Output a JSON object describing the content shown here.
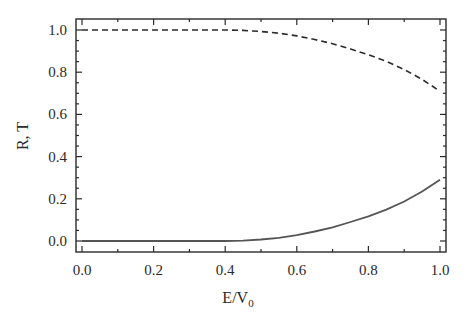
{
  "chart_data": {
    "type": "line",
    "title": "",
    "xlabel": "E/V",
    "xlabel_subscript": "0",
    "ylabel": "R, T",
    "xlim": [
      -0.02,
      1.02
    ],
    "ylim": [
      -0.05,
      1.05
    ],
    "xticks": [
      "0.0",
      "0.2",
      "0.4",
      "0.6",
      "0.8",
      "1.0"
    ],
    "yticks": [
      "0.0",
      "0.2",
      "0.4",
      "0.6",
      "0.8",
      "1.0"
    ],
    "grid": false,
    "legend": "none",
    "series": [
      {
        "name": "T",
        "style": "dashed",
        "color": "#2b2b2b",
        "x": [
          0.0,
          0.1,
          0.2,
          0.3,
          0.4,
          0.45,
          0.5,
          0.55,
          0.6,
          0.65,
          0.7,
          0.75,
          0.8,
          0.85,
          0.9,
          0.95,
          1.0
        ],
        "y": [
          1.0,
          1.0,
          1.0,
          1.0,
          1.0,
          0.998,
          0.993,
          0.985,
          0.972,
          0.955,
          0.935,
          0.91,
          0.883,
          0.851,
          0.813,
          0.766,
          0.71
        ]
      },
      {
        "name": "R",
        "style": "solid",
        "color": "#555555",
        "x": [
          0.0,
          0.1,
          0.2,
          0.3,
          0.4,
          0.45,
          0.5,
          0.55,
          0.6,
          0.65,
          0.7,
          0.75,
          0.8,
          0.85,
          0.9,
          0.95,
          1.0
        ],
        "y": [
          0.0,
          0.0,
          0.0,
          0.0,
          0.0,
          0.002,
          0.007,
          0.015,
          0.028,
          0.045,
          0.065,
          0.09,
          0.117,
          0.149,
          0.187,
          0.234,
          0.29
        ]
      }
    ]
  }
}
